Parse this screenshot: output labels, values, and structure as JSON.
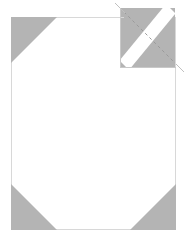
{
  "figure": {
    "type": "diagram",
    "title": "",
    "canvas": {
      "width": 186,
      "height": 243,
      "background": "#ffffff"
    },
    "colors": {
      "page_fill": "#ffffff",
      "page_border": "#d8d8d8",
      "corner_gray": "#b4b4b4",
      "fold_gray": "#b4b4b4",
      "fold_band": "#ffffff",
      "fold_dash": "#9a9a9a",
      "fold_outline": "#c8c8c8"
    },
    "page": {
      "name": "page-sheet",
      "x": 11,
      "y": 17,
      "width": 165,
      "height": 213,
      "border_width": 1
    },
    "corners": [
      {
        "name": "corner-top-left",
        "position": "top-left",
        "points": "11,17 57,17 11,63",
        "fill": "#b4b4b4"
      },
      {
        "name": "corner-bottom-left",
        "position": "bottom-left",
        "points": "11,184 11,230 57,230",
        "fill": "#b4b4b4"
      },
      {
        "name": "corner-bottom-right",
        "position": "bottom-right",
        "points": "176,184 176,230 130,230",
        "fill": "#b4b4b4"
      }
    ],
    "fold": {
      "name": "fold-corner-top-right",
      "square": {
        "x": 120,
        "y": 8,
        "width": 55,
        "height": 59
      },
      "fill": "#b4b4b4",
      "band": {
        "name": "fold-crease-band",
        "points": "166,4 175,13 129,70 120,61",
        "fill": "#ffffff"
      },
      "dashed_line": {
        "name": "fold-dashed-line",
        "x1": 124,
        "y1": 12,
        "x2": 176,
        "y2": 64,
        "stroke": "#9a9a9a",
        "dash_array": "3 3",
        "stroke_width": 1
      },
      "tick_top": {
        "name": "fold-tick-top",
        "x1": 116,
        "y1": 4,
        "x2": 124,
        "y2": 12
      },
      "tick_bottom": {
        "name": "fold-tick-bottom",
        "x1": 176,
        "y1": 64,
        "x2": 184,
        "y2": 72
      },
      "guide_top": {
        "name": "fold-guide-top",
        "x1": 110,
        "y1": 17,
        "x2": 124,
        "y2": 17
      },
      "guide_right": {
        "name": "fold-guide-right",
        "x1": 176,
        "y1": 60,
        "x2": 176,
        "y2": 76
      }
    }
  }
}
